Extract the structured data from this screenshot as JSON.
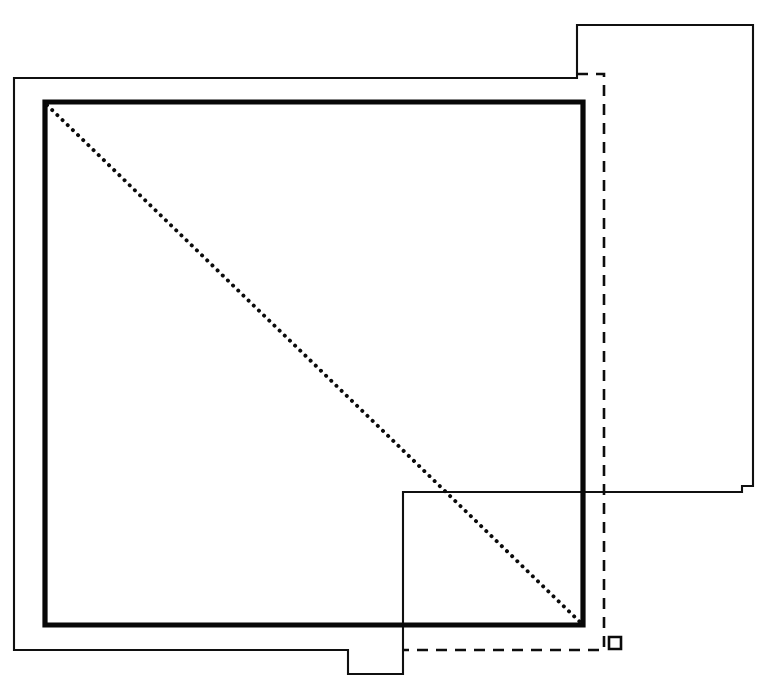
{
  "drawing": {
    "kind": "architectural-line-drawing",
    "title": "",
    "canvas": {
      "width": 773,
      "height": 682,
      "background": "#ffffff"
    },
    "colors": {
      "ink": "#0a0a0a",
      "thin_stroke": "#101010",
      "thick_stroke": "#080808",
      "dashed_stroke": "#0d0d0d",
      "dotted_stroke": "#0a0a0a",
      "background": "#ffffff"
    },
    "stroke_weights": {
      "thin": 2.1,
      "thick": 5.2,
      "dashed": 2.6,
      "dotted": 3.9
    }
  },
  "chart_data": {
    "type": "line",
    "title": "",
    "xlabel": "",
    "ylabel": "",
    "grid": false,
    "legend": "none",
    "xlim": [
      0,
      773
    ],
    "ylim": [
      0,
      682
    ],
    "series": [
      {
        "name": "outer-thin-outline",
        "style": "solid",
        "weight": "thin",
        "closed": false,
        "points": [
          [
            753,
            486
          ],
          [
            753,
            25
          ],
          [
            577,
            25
          ],
          [
            577,
            78
          ],
          [
            14,
            78
          ],
          [
            14,
            650
          ],
          [
            348,
            650
          ],
          [
            348,
            674
          ],
          [
            403,
            674
          ],
          [
            403,
            492
          ],
          [
            742,
            492
          ],
          [
            742,
            486
          ],
          [
            753,
            486
          ]
        ]
      },
      {
        "name": "inner-thick-room",
        "style": "solid",
        "weight": "thick",
        "closed": true,
        "points": [
          [
            45,
            102
          ],
          [
            583,
            102
          ],
          [
            583,
            625
          ],
          [
            45,
            625
          ]
        ]
      },
      {
        "name": "dashed-offset-line",
        "style": "dashed",
        "weight": "dashed",
        "closed": false,
        "points": [
          [
            577,
            74
          ],
          [
            604,
            74
          ],
          [
            604,
            650
          ],
          [
            403,
            650
          ]
        ]
      },
      {
        "name": "dotted-diagonal",
        "style": "dotted",
        "weight": "dotted",
        "closed": false,
        "points": [
          [
            47,
            105
          ],
          [
            581,
            623
          ]
        ]
      },
      {
        "name": "corner-marker-square",
        "style": "solid",
        "weight": "dashed",
        "closed": true,
        "points": [
          [
            609,
            637
          ],
          [
            621,
            637
          ],
          [
            621,
            649
          ],
          [
            609,
            649
          ]
        ]
      }
    ]
  },
  "elements": {
    "outer_outline_label": "outer building outline",
    "inner_room_label": "inner room outline",
    "dashed_line_label": "dashed setback line",
    "dotted_diagonal_label": "dotted diagonal",
    "marker_label": "corner marker",
    "lower_right_wing_label": "lower right wing",
    "bottom_notch_label": "bottom notch",
    "upper_right_wing_label": "upper right wing"
  }
}
